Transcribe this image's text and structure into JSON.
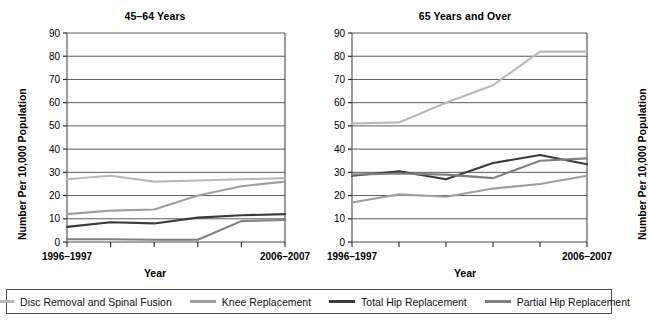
{
  "figure": {
    "ylabel": "Number Per 10,000 Population",
    "xlabel": "Year",
    "x_tick_labels": [
      "1996–1997",
      "",
      "",
      "",
      "",
      "2006–2007"
    ],
    "y_ticks": [
      0,
      10,
      20,
      30,
      40,
      50,
      60,
      70,
      80,
      90
    ]
  },
  "legend": {
    "items": [
      {
        "label": "Disc Removal and Spinal Fusion",
        "color": "#b9b9b9"
      },
      {
        "label": "Knee Replacement",
        "color": "#a0a0a0"
      },
      {
        "label": "Total Hip Replacement",
        "color": "#3a3a3a"
      },
      {
        "label": "Partial Hip Replacement",
        "color": "#808080"
      }
    ]
  },
  "chart_data": [
    {
      "type": "line",
      "title": "45–64 Years",
      "xlabel": "Year",
      "ylabel": "Number Per 10,000 Population",
      "ylim": [
        0,
        90
      ],
      "yticks": [
        0,
        10,
        20,
        30,
        40,
        50,
        60,
        70,
        80,
        90
      ],
      "grid": true,
      "legend_position": "bottom",
      "x": [
        "1996–1997",
        "1998–1999",
        "2000–2001",
        "2002–2003",
        "2004–2005",
        "2006–2007"
      ],
      "x_tick_labels": [
        "1996–1997",
        "",
        "",
        "",
        "",
        "2006–2007"
      ],
      "series": [
        {
          "name": "Disc Removal and Spinal Fusion",
          "color": "#b9b9b9",
          "values": [
            27,
            28.5,
            26,
            26.5,
            27,
            27.5
          ]
        },
        {
          "name": "Knee Replacement",
          "color": "#a0a0a0",
          "values": [
            12,
            13.5,
            14,
            20,
            24,
            26
          ]
        },
        {
          "name": "Total Hip Replacement",
          "color": "#3a3a3a",
          "values": [
            6.5,
            8.5,
            8,
            10.5,
            11.5,
            12
          ]
        },
        {
          "name": "Partial Hip Replacement",
          "color": "#808080",
          "values": [
            1.2,
            1.2,
            1,
            1,
            9,
            9.5
          ]
        }
      ]
    },
    {
      "type": "line",
      "title": "65 Years and Over",
      "xlabel": "Year",
      "ylabel": "Number Per 10,000 Population",
      "ylim": [
        0,
        90
      ],
      "yticks": [
        0,
        10,
        20,
        30,
        40,
        50,
        60,
        70,
        80,
        90
      ],
      "grid": true,
      "legend_position": "bottom",
      "x": [
        "1996–1997",
        "1998–1999",
        "2000–2001",
        "2002–2003",
        "2004–2005",
        "2006–2007"
      ],
      "x_tick_labels": [
        "1996–1997",
        "",
        "",
        "",
        "",
        "2006–2007"
      ],
      "series": [
        {
          "name": "Disc Removal and Spinal Fusion",
          "color": "#b9b9b9",
          "values": [
            51,
            51.5,
            60,
            67.5,
            82,
            82
          ]
        },
        {
          "name": "Knee Replacement",
          "color": "#a0a0a0",
          "values": [
            17,
            20.5,
            19.5,
            23,
            25,
            28.5
          ]
        },
        {
          "name": "Total Hip Replacement",
          "color": "#3a3a3a",
          "values": [
            28.5,
            30.5,
            27,
            34,
            37.5,
            33.5
          ]
        },
        {
          "name": "Partial Hip Replacement",
          "color": "#808080",
          "values": [
            29,
            29.5,
            29,
            27.5,
            35,
            36
          ]
        }
      ]
    }
  ]
}
